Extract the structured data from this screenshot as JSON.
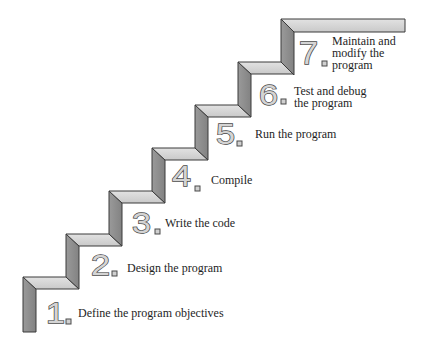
{
  "diagram": {
    "type": "staircase",
    "colors": {
      "tread": "#d6d6d6",
      "riser": "#8e8e8e",
      "outline": "#3a3a3a",
      "numeral_fill": "#d4d4d4",
      "numeral_outline": "#4a4a4a",
      "text": "#1e1e1e"
    },
    "steps": [
      {
        "number": "1",
        "lines": [
          "Define the program objectives"
        ]
      },
      {
        "number": "2",
        "lines": [
          "Design the program"
        ]
      },
      {
        "number": "3",
        "lines": [
          "Write the code"
        ]
      },
      {
        "number": "4",
        "lines": [
          "Compile"
        ]
      },
      {
        "number": "5",
        "lines": [
          "Run the program"
        ]
      },
      {
        "number": "6",
        "lines": [
          "Test and debug",
          "the program"
        ]
      },
      {
        "number": "7",
        "lines": [
          "Maintain and",
          "modify the",
          "program"
        ]
      }
    ]
  }
}
